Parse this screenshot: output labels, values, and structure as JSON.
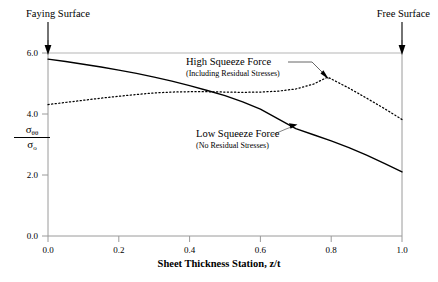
{
  "chart_data": {
    "type": "line",
    "title": "",
    "xlabel": "Sheet Thickness Station, z/t",
    "ylabel": "σθθ / σo",
    "xlim": [
      0.0,
      1.0
    ],
    "ylim": [
      0.0,
      6.0
    ],
    "grid": false,
    "xticks": [
      "0.0",
      "0.2",
      "0.4",
      "0.6",
      "0.8",
      "1.0"
    ],
    "xtick_values": [
      0.0,
      0.2,
      0.4,
      0.6,
      0.8,
      1.0
    ],
    "yticks": [
      "0.0",
      "2.0",
      "4.0",
      "6.0"
    ],
    "ytick_values": [
      0.0,
      2.0,
      4.0,
      6.0
    ],
    "legend_position": "inline-annotations",
    "series": [
      {
        "name": "High Squeeze Force",
        "style": "dotted",
        "color": "#000000",
        "x": [
          0.0,
          0.05,
          0.1,
          0.15,
          0.2,
          0.25,
          0.3,
          0.35,
          0.4,
          0.45,
          0.5,
          0.55,
          0.6,
          0.65,
          0.7,
          0.75,
          0.79,
          0.85,
          0.9,
          0.95,
          1.0
        ],
        "values": [
          4.31,
          4.38,
          4.45,
          4.52,
          4.58,
          4.64,
          4.69,
          4.72,
          4.73,
          4.73,
          4.72,
          4.71,
          4.72,
          4.75,
          4.82,
          4.98,
          5.21,
          4.85,
          4.52,
          4.18,
          3.82
        ]
      },
      {
        "name": "Low Squeeze Force",
        "style": "solid",
        "color": "#000000",
        "x": [
          0.0,
          0.05,
          0.1,
          0.15,
          0.2,
          0.25,
          0.3,
          0.35,
          0.4,
          0.45,
          0.5,
          0.55,
          0.6,
          0.65,
          0.7,
          0.75,
          0.8,
          0.85,
          0.9,
          0.95,
          1.0
        ],
        "values": [
          5.8,
          5.72,
          5.63,
          5.54,
          5.44,
          5.33,
          5.21,
          5.08,
          4.93,
          4.77,
          4.6,
          4.4,
          4.16,
          3.84,
          3.52,
          3.32,
          3.12,
          2.9,
          2.65,
          2.38,
          2.1
        ]
      }
    ],
    "annotations": [
      {
        "id": "high-squeeze",
        "title": "High Squeeze Force",
        "subtitle": "(Including Residual Stresses)",
        "points_to": {
          "x": 0.79,
          "y": 5.21
        }
      },
      {
        "id": "low-squeeze",
        "title": "Low Squeeze Force",
        "subtitle": "(No Residual Stresses)",
        "points_to": {
          "x": 0.675,
          "y": 3.58
        }
      },
      {
        "id": "faying-surface",
        "title": "Faying Surface",
        "points_to": {
          "x": 0.0,
          "y": 6.0
        }
      },
      {
        "id": "free-surface",
        "title": "Free Surface",
        "points_to": {
          "x": 1.0,
          "y": 6.0
        }
      }
    ]
  },
  "labels": {
    "faying_surface": "Faying Surface",
    "free_surface": "Free Surface",
    "high_squeeze_title": "High Squeeze Force",
    "high_squeeze_sub": "(Including Residual Stresses)",
    "low_squeeze_title": "Low Squeeze Force",
    "low_squeeze_sub": "(No Residual Stresses)",
    "x_axis_title": "Sheet Thickness Station, z/t",
    "y_axis_numerator": "σ",
    "y_axis_numerator_sub": "θθ",
    "y_axis_denominator": "σ",
    "y_axis_denominator_sub": "o"
  },
  "colors": {
    "axis": "#9a9a9a",
    "curve": "#000000",
    "text": "#000000",
    "background": "#ffffff"
  }
}
